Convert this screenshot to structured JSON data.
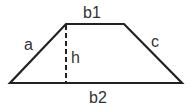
{
  "diagram": {
    "type": "trapezoid",
    "labels": {
      "top_base": "b1",
      "bottom_base": "b2",
      "left_side": "a",
      "right_side": "c",
      "height": "h"
    },
    "colors": {
      "stroke": "#222222",
      "text": "#333333",
      "background": "#ffffff"
    }
  }
}
